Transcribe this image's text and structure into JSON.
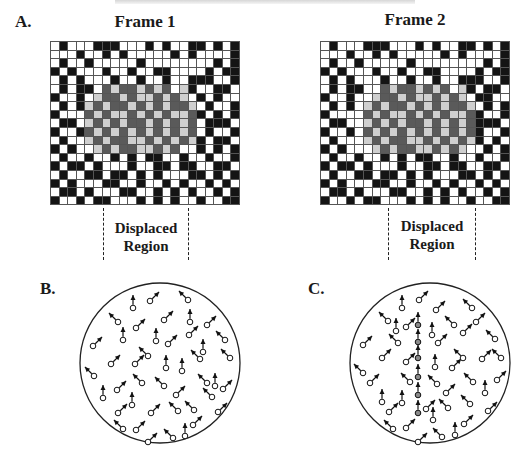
{
  "header": {
    "text_cropped": true
  },
  "panels": {
    "A": {
      "label": "A.",
      "frames": [
        {
          "title": "Frame 1",
          "region_label_line1": "Displaced",
          "region_label_line2": "Region",
          "grid": {
            "x": 50,
            "y": 41,
            "cols": 22,
            "rows": 19,
            "cell": 8.6,
            "rows_data": [
              "0100011100010100110101",
              "0001001010000010100001",
              "0100100000100000000101",
              "1010001001001100001011",
              "0101000100100100111001",
              "0101102322323203100110",
              "1001032232332323010100",
              "0101323223232322301001",
              "1000232332323233210101",
              "0110323232232323201110",
              "1001232323232323201001",
              "0100323223323232310110",
              "1010032322332320010101",
              "0100100101011001001001",
              "1011010001001101100110",
              "0100110110101000110101",
              "1010001100100101001010",
              "0110100011001010100101",
              "1001011000101010010011"
            ]
          },
          "dashes": [
            103,
            188
          ]
        },
        {
          "title": "Frame 2",
          "region_label_line1": "Displaced",
          "region_label_line2": "Region",
          "grid": {
            "x": 320,
            "y": 41,
            "cols": 22,
            "rows": 19,
            "cell": 8.6,
            "rows_data": [
              "0100011100010100110101",
              "0001001010000010100001",
              "0100100000100000000101",
              "1010001001001100001011",
              "0101000100100100111001",
              "0101100232232320310110",
              "1001003223233232301100",
              "0101032322323232230101",
              "1000023233232323321001",
              "0110032323223232321110",
              "1001023232323232321001",
              "0100032322332323231010",
              "1010003232233232300101",
              "0100100101011001001001",
              "1011010001001101100110",
              "0100110110101000110101",
              "1010001100100101001010",
              "0110100011001010100101",
              "1001011000101010010011"
            ]
          },
          "dashes": [
            388,
            475
          ]
        }
      ]
    },
    "B": {
      "label": "B.",
      "circle": {
        "cx": 160,
        "cy": 363,
        "r": 80
      },
      "dots": [
        [
          133,
          308,
          "u"
        ],
        [
          150,
          301,
          "ur"
        ],
        [
          188,
          300,
          "ul"
        ],
        [
          118,
          322,
          "ul"
        ],
        [
          136,
          328,
          "ur"
        ],
        [
          164,
          320,
          "ur"
        ],
        [
          190,
          322,
          "u"
        ],
        [
          207,
          325,
          "ur"
        ],
        [
          123,
          340,
          "u"
        ],
        [
          93,
          346,
          "ur"
        ],
        [
          156,
          341,
          "u"
        ],
        [
          168,
          344,
          "ur"
        ],
        [
          189,
          335,
          "ur"
        ],
        [
          203,
          352,
          "u"
        ],
        [
          225,
          340,
          "ul"
        ],
        [
          230,
          358,
          "ul"
        ],
        [
          111,
          364,
          "ur"
        ],
        [
          135,
          364,
          "ur"
        ],
        [
          148,
          356,
          "ul"
        ],
        [
          166,
          368,
          "u"
        ],
        [
          182,
          371,
          "u"
        ],
        [
          200,
          359,
          "ul"
        ],
        [
          94,
          376,
          "ul"
        ],
        [
          142,
          383,
          "ul"
        ],
        [
          117,
          390,
          "ur"
        ],
        [
          164,
          386,
          "ul"
        ],
        [
          207,
          383,
          "ul"
        ],
        [
          215,
          386,
          "u"
        ],
        [
          223,
          389,
          "ur"
        ],
        [
          212,
          397,
          "ul"
        ],
        [
          103,
          398,
          "u"
        ],
        [
          132,
          405,
          "u"
        ],
        [
          176,
          395,
          "ur"
        ],
        [
          178,
          411,
          "ul"
        ],
        [
          194,
          410,
          "ul"
        ],
        [
          118,
          413,
          "ur"
        ],
        [
          151,
          413,
          "ur"
        ],
        [
          218,
          412,
          "ur"
        ],
        [
          123,
          429,
          "ul"
        ],
        [
          136,
          430,
          "ur"
        ],
        [
          193,
          425,
          "ur"
        ],
        [
          148,
          442,
          "ur"
        ],
        [
          173,
          438,
          "ul"
        ],
        [
          185,
          436,
          "u"
        ]
      ]
    },
    "C": {
      "label": "C.",
      "circle": {
        "cx": 430,
        "cy": 363,
        "r": 80
      },
      "dots": [
        [
          402,
          308,
          "u"
        ],
        [
          419,
          300,
          "ur"
        ],
        [
          472,
          308,
          "ul"
        ],
        [
          388,
          321,
          "ul"
        ],
        [
          396,
          331,
          "u"
        ],
        [
          406,
          327,
          "ur"
        ],
        [
          436,
          310,
          "ur"
        ],
        [
          454,
          325,
          "ul"
        ],
        [
          476,
          322,
          "ur"
        ],
        [
          363,
          345,
          "ur"
        ],
        [
          398,
          343,
          "ul"
        ],
        [
          432,
          335,
          "u"
        ],
        [
          438,
          343,
          "ur"
        ],
        [
          463,
          333,
          "ur"
        ],
        [
          495,
          339,
          "ul"
        ],
        [
          382,
          358,
          "ur"
        ],
        [
          406,
          362,
          "ur"
        ],
        [
          435,
          367,
          "u"
        ],
        [
          452,
          368,
          "ur"
        ],
        [
          463,
          358,
          "ul"
        ],
        [
          482,
          359,
          "ur"
        ],
        [
          501,
          358,
          "ul"
        ],
        [
          363,
          373,
          "ul"
        ],
        [
          370,
          383,
          "ur"
        ],
        [
          410,
          382,
          "ul"
        ],
        [
          437,
          384,
          "ul"
        ],
        [
          446,
          393,
          "ur"
        ],
        [
          473,
          382,
          "ul"
        ],
        [
          485,
          393,
          "u"
        ],
        [
          497,
          380,
          "ur"
        ],
        [
          382,
          402,
          "u"
        ],
        [
          402,
          403,
          "u"
        ],
        [
          426,
          409,
          "ur"
        ],
        [
          433,
          420,
          "u"
        ],
        [
          448,
          408,
          "ul"
        ],
        [
          470,
          404,
          "ul"
        ],
        [
          389,
          412,
          "ur"
        ],
        [
          488,
          411,
          "ur"
        ],
        [
          393,
          429,
          "ul"
        ],
        [
          406,
          428,
          "ur"
        ],
        [
          464,
          424,
          "ur"
        ],
        [
          418,
          442,
          "ur"
        ],
        [
          442,
          437,
          "ul"
        ],
        [
          455,
          435,
          "u"
        ]
      ],
      "coherent_dots": [
        [
          418,
          325,
          "u"
        ],
        [
          418,
          342,
          "u"
        ],
        [
          418,
          358,
          "u"
        ],
        [
          418,
          377,
          "u"
        ],
        [
          418,
          395,
          "u"
        ],
        [
          418,
          413,
          "u"
        ]
      ]
    }
  },
  "colors": {
    "black_cell": "#141414",
    "dark_gray_cell": "#5a5a5a",
    "light_gray_cell": "#cfcfcf",
    "coherent_dot": "#8a8a8a"
  }
}
